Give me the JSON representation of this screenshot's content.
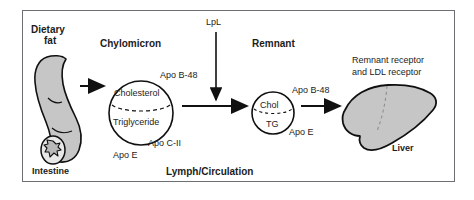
{
  "figure": {
    "title_region": "chylomicron-metabolism-pathway",
    "colors": {
      "organ_fill": "#c6c6c6",
      "organ_stroke": "#101010",
      "frame_stroke": "#6d6f74",
      "text": "#1c1c1c",
      "background": "#ffffff"
    }
  },
  "labels": {
    "dietary_fat_line1": "Dietary",
    "dietary_fat_line2": "fat",
    "intestine": "Intestine",
    "chylomicron": "Chylomicron",
    "lpl": "LpL",
    "remnant": "Remnant",
    "liver": "Liver",
    "lymph_circulation": "Lymph/Circulation",
    "receptor_line1": "Remnant receptor",
    "receptor_line2": "and LDL receptor"
  },
  "chylomicron_particle": {
    "core_top": "Cholesterol",
    "core_bottom": "Triglyceride",
    "apo_b48": "Apo B-48",
    "apo_cii": "Apo C-II",
    "apo_e": "Apo E"
  },
  "remnant_particle": {
    "core_top": "Chol",
    "core_bottom": "TG",
    "apo_b48": "Apo B-48",
    "apo_e": "Apo E"
  },
  "arrows": [
    {
      "name": "intestine-to-chylomicron",
      "direction": "right"
    },
    {
      "name": "chylomicron-to-remnant",
      "direction": "right"
    },
    {
      "name": "lpl-to-pathway",
      "direction": "down"
    },
    {
      "name": "remnant-to-liver",
      "direction": "right"
    }
  ]
}
